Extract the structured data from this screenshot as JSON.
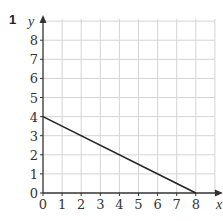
{
  "question_number": "1",
  "chart_data": {
    "type": "line",
    "title": "",
    "xlabel": "x",
    "ylabel": "y",
    "xlim": [
      0,
      9
    ],
    "ylim": [
      0,
      9
    ],
    "x_ticks": [
      "0",
      "1",
      "2",
      "3",
      "4",
      "5",
      "6",
      "7",
      "8"
    ],
    "y_ticks": [
      "0",
      "1",
      "2",
      "3",
      "4",
      "5",
      "6",
      "7",
      "8"
    ],
    "grid": true,
    "series": [
      {
        "name": "line",
        "points": [
          [
            0,
            4
          ],
          [
            8,
            0
          ]
        ],
        "color": "#222222"
      }
    ]
  },
  "colors": {
    "grid": "#d4d4d4",
    "axis": "#333333",
    "line": "#222222"
  }
}
